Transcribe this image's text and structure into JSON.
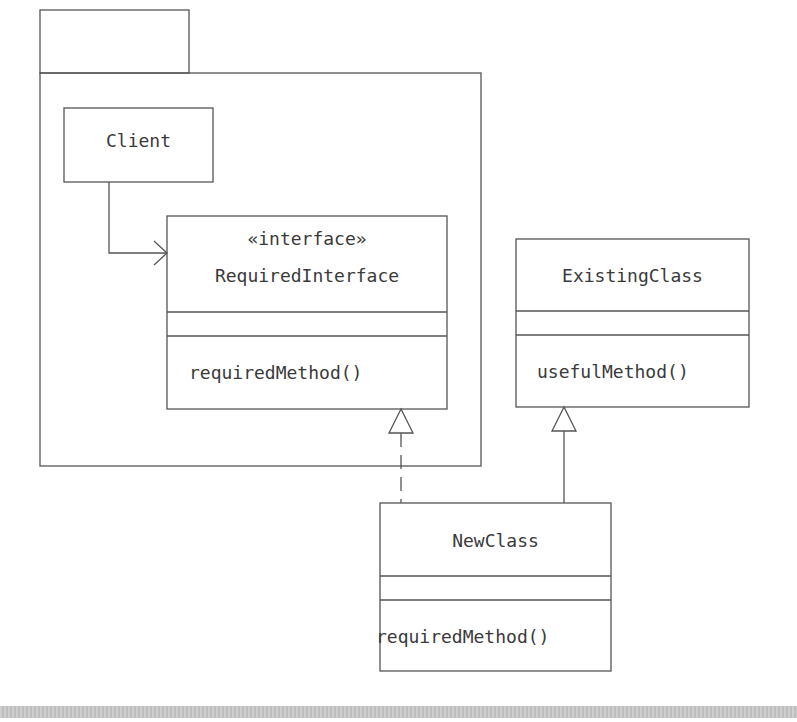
{
  "diagram": {
    "type": "UML class diagram (Adapter pattern)",
    "package": {
      "label": ""
    },
    "classes": {
      "client": {
        "name": "Client"
      },
      "required_interface": {
        "stereotype": "«interface»",
        "name": "RequiredInterface",
        "attributes": [],
        "methods": [
          "requiredMethod()"
        ]
      },
      "existing_class": {
        "name": "ExistingClass",
        "attributes": [],
        "methods": [
          "usefulMethod()"
        ]
      },
      "new_class": {
        "name": "NewClass",
        "attributes": [],
        "methods": [
          "requiredMethod()"
        ]
      }
    },
    "relationships": [
      {
        "from": "Client",
        "to": "RequiredInterface",
        "type": "association"
      },
      {
        "from": "NewClass",
        "to": "RequiredInterface",
        "type": "realization"
      },
      {
        "from": "NewClass",
        "to": "ExistingClass",
        "type": "generalization"
      }
    ],
    "colors": {
      "line": "#555555",
      "text": "#3a3a3a",
      "background": "#ffffff",
      "footer_bar": "#c8c8c8"
    }
  }
}
